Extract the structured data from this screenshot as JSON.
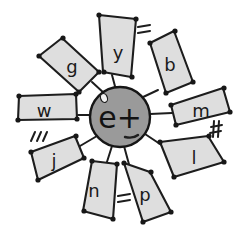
{
  "diagram": {
    "canvas": {
      "width": 248,
      "height": 239,
      "background": "#ffffff"
    },
    "style": {
      "petal_fill": "#dedede",
      "petal_stroke": "#1d1d1d",
      "nucleus_fill": "#9a9a9a",
      "nucleus_stroke": "#161616",
      "label_color": "#1a1a1a",
      "dot_color": "#171717"
    },
    "nucleus": {
      "label": "e+",
      "center_x": 120,
      "center_y": 117,
      "radius": 30,
      "speck_label": "highlight-speck",
      "smudge_label": "shading-smudge"
    },
    "petals": [
      {
        "id": "petal-y",
        "label": "y",
        "angle_deg": 85,
        "label_x": 118,
        "label_y": 52,
        "points": "99,15 136,19 131,77 103,72",
        "dots": [
          [
            99,
            15
          ],
          [
            136,
            19
          ],
          [
            132,
            77
          ],
          [
            104,
            72
          ]
        ],
        "spoke": "112,75 116,90"
      },
      {
        "id": "petal-b",
        "label": "b",
        "angle_deg": 55,
        "label_x": 170,
        "label_y": 64,
        "points": "150,43 174,31 193,82 166,93",
        "dots": [
          [
            150,
            43
          ],
          [
            175,
            31
          ],
          [
            193,
            82
          ],
          [
            166,
            93
          ]
        ],
        "spoke": "158,90 141,98"
      },
      {
        "id": "petal-m",
        "label": "m",
        "angle_deg": 12,
        "label_x": 201,
        "label_y": 110,
        "points": "171,105 223,88 230,112 176,125",
        "dots": [
          [
            171,
            105
          ],
          [
            224,
            88
          ],
          [
            230,
            112
          ],
          [
            176,
            125
          ]
        ],
        "spoke": "172,113 150,114"
      },
      {
        "id": "petal-l",
        "label": "l",
        "angle_deg": -26,
        "label_x": 194,
        "label_y": 157,
        "points": "160,142 208,136 224,162 174,177",
        "dots": [
          [
            160,
            142
          ],
          [
            209,
            136
          ],
          [
            224,
            162
          ],
          [
            174,
            177
          ]
        ],
        "spoke": "163,146 145,134"
      },
      {
        "id": "petal-p",
        "label": "p",
        "angle_deg": -63,
        "label_x": 145,
        "label_y": 194,
        "points": "124,163 150,172 171,212 143,222",
        "dots": [
          [
            124,
            163
          ],
          [
            151,
            172
          ],
          [
            171,
            212
          ],
          [
            143,
            222
          ]
        ],
        "spoke": "130,168 124,146"
      },
      {
        "id": "petal-n",
        "label": "n",
        "angle_deg": -100,
        "label_x": 94,
        "label_y": 190,
        "points": "92,161 117,164 113,219 83,211",
        "dots": [
          [
            92,
            161
          ],
          [
            117,
            164
          ],
          [
            113,
            219
          ],
          [
            84,
            211
          ]
        ],
        "spoke": "106,165 112,146"
      },
      {
        "id": "petal-j",
        "label": "j",
        "angle_deg": -152,
        "label_x": 54,
        "label_y": 160,
        "points": "31,152 75,136 84,158 38,180",
        "dots": [
          [
            31,
            152
          ],
          [
            76,
            136
          ],
          [
            84,
            158
          ],
          [
            38,
            180
          ]
        ],
        "spoke": "80,146 97,136"
      },
      {
        "id": "petal-w",
        "label": "w",
        "angle_deg": 180,
        "label_x": 44,
        "label_y": 110,
        "points": "19,96 76,94 77,119 18,120",
        "dots": [
          [
            19,
            96
          ],
          [
            76,
            94
          ],
          [
            77,
            119
          ],
          [
            18,
            120
          ]
        ],
        "spoke": "78,115 92,115"
      },
      {
        "id": "petal-g",
        "label": "g",
        "angle_deg": 140,
        "label_x": 72,
        "label_y": 66,
        "points": "39,56 62,38 99,72 79,92",
        "dots": [
          [
            39,
            56
          ],
          [
            63,
            38
          ],
          [
            99,
            72
          ],
          [
            79,
            92
          ]
        ],
        "spoke": "92,82 105,94"
      }
    ],
    "annotations": [
      {
        "id": "mark-equals-top",
        "glyph": "=",
        "near": "petal-y",
        "x": 142,
        "y": 30,
        "strokes": [
          [
            138,
            27,
            150,
            25
          ],
          [
            138,
            33,
            150,
            31
          ]
        ]
      },
      {
        "id": "mark-hash-right",
        "glyph": "#",
        "near": "petal-m",
        "x": 215,
        "y": 130,
        "strokes": [
          [
            211,
            127,
            222,
            125
          ],
          [
            210,
            133,
            221,
            131
          ],
          [
            214,
            121,
            213,
            137
          ],
          [
            219,
            121,
            218,
            137
          ]
        ]
      },
      {
        "id": "mark-equals-bottom",
        "glyph": "=",
        "near": "petal-p",
        "x": 124,
        "y": 199,
        "strokes": [
          [
            118,
            196,
            130,
            194
          ],
          [
            118,
            202,
            130,
            200
          ]
        ]
      },
      {
        "id": "mark-triple-slash",
        "glyph": "|||",
        "near": "petal-j",
        "x": 36,
        "y": 138,
        "strokes": [
          [
            31,
            141,
            35,
            132
          ],
          [
            37,
            141,
            41,
            132
          ],
          [
            43,
            141,
            47,
            132
          ]
        ]
      }
    ]
  }
}
